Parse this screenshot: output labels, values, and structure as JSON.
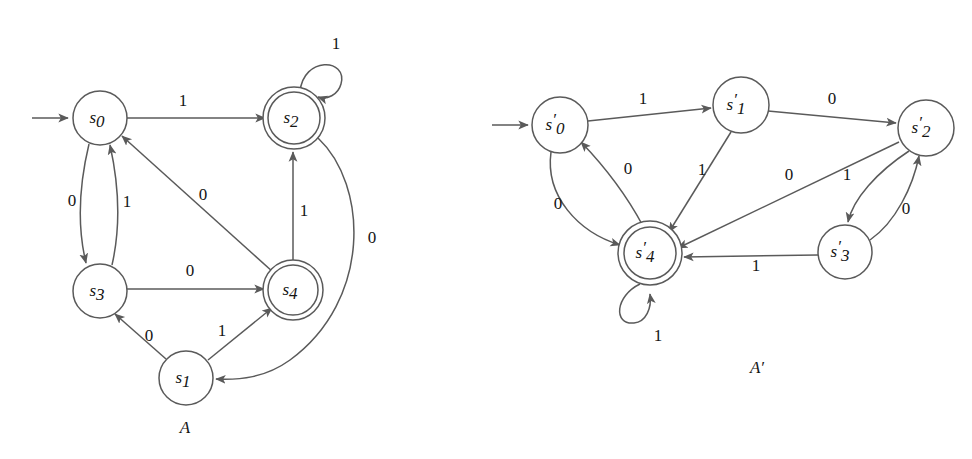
{
  "figure": {
    "background_color": "#ffffff",
    "stroke_color": "#5a5a5a",
    "text_color": "#141414"
  },
  "automata": [
    {
      "id": "A",
      "caption": "A",
      "caption_pos": {
        "x": 185,
        "y": 429
      },
      "start_arrow": {
        "x1": 32,
        "y1": 118,
        "x2": 70,
        "y2": 118
      },
      "states": [
        {
          "id": "s0",
          "base": "s",
          "sub": "0",
          "prime": "",
          "x": 100,
          "y": 118,
          "r": 27,
          "accepting": false
        },
        {
          "id": "s2",
          "base": "s",
          "sub": "2",
          "prime": "",
          "x": 294,
          "y": 118,
          "r": 26,
          "accepting": true
        },
        {
          "id": "s3",
          "base": "s",
          "sub": "3",
          "prime": "",
          "x": 100,
          "y": 291,
          "r": 27,
          "accepting": false
        },
        {
          "id": "s4",
          "base": "s",
          "sub": "4",
          "prime": "",
          "x": 293,
          "y": 290,
          "r": 25,
          "accepting": true
        },
        {
          "id": "s1",
          "base": "s",
          "sub": "1",
          "prime": "",
          "x": 186,
          "y": 378,
          "r": 27,
          "accepting": false
        }
      ],
      "transitions": [
        {
          "from": "s0",
          "to": "s2",
          "symbol": "1",
          "label_x": 183,
          "label_y": 102
        },
        {
          "from": "s2",
          "to": "s2",
          "symbol": "1",
          "label_x": 336,
          "label_y": 45,
          "self_loop": true
        },
        {
          "from": "s0",
          "to": "s3",
          "symbol": "0",
          "label_x": 72,
          "label_y": 202
        },
        {
          "from": "s3",
          "to": "s0",
          "symbol": "1",
          "label_x": 127,
          "label_y": 203
        },
        {
          "from": "s4",
          "to": "s0",
          "symbol": "0",
          "label_x": 203,
          "label_y": 196
        },
        {
          "from": "s4",
          "to": "s2",
          "symbol": "1",
          "label_x": 304,
          "label_y": 212
        },
        {
          "from": "s2",
          "to": "s1",
          "symbol": "0",
          "label_x": 372,
          "label_y": 239
        },
        {
          "from": "s3",
          "to": "s4",
          "symbol": "0",
          "label_x": 190,
          "label_y": 272
        },
        {
          "from": "s1",
          "to": "s3",
          "symbol": "0",
          "label_x": 149,
          "label_y": 337
        },
        {
          "from": "s1",
          "to": "s4",
          "symbol": "1",
          "label_x": 222,
          "label_y": 332
        }
      ]
    },
    {
      "id": "Aprime",
      "caption": "A′",
      "caption_pos": {
        "x": 757,
        "y": 369
      },
      "start_arrow": {
        "x1": 492,
        "y1": 125,
        "x2": 530,
        "y2": 125
      },
      "states": [
        {
          "id": "s0p",
          "base": "s",
          "sub": "0",
          "prime": "′",
          "x": 560,
          "y": 125,
          "r": 28,
          "accepting": false
        },
        {
          "id": "s1p",
          "base": "s",
          "sub": "1",
          "prime": "′",
          "x": 741,
          "y": 105,
          "r": 28,
          "accepting": false
        },
        {
          "id": "s2p",
          "base": "s",
          "sub": "2",
          "prime": "′",
          "x": 926,
          "y": 128,
          "r": 28,
          "accepting": false
        },
        {
          "id": "s4p",
          "base": "s",
          "sub": "4",
          "prime": "′",
          "x": 650,
          "y": 253,
          "r": 26,
          "accepting": true
        },
        {
          "id": "s3p",
          "base": "s",
          "sub": "3",
          "prime": "′",
          "x": 845,
          "y": 252,
          "r": 27,
          "accepting": false
        }
      ],
      "transitions": [
        {
          "from": "s0p",
          "to": "s1p",
          "symbol": "1",
          "label_x": 643,
          "label_y": 100
        },
        {
          "from": "s1p",
          "to": "s2p",
          "symbol": "0",
          "label_x": 832,
          "label_y": 100
        },
        {
          "from": "s0p",
          "to": "s4p",
          "symbol": "0",
          "label_x": 558,
          "label_y": 205
        },
        {
          "from": "s4p",
          "to": "s0p",
          "symbol": "0",
          "label_x": 628,
          "label_y": 170
        },
        {
          "from": "s1p",
          "to": "s4p",
          "symbol": "1",
          "label_x": 702,
          "label_y": 171
        },
        {
          "from": "s2p",
          "to": "s4p",
          "symbol": "0",
          "label_x": 789,
          "label_y": 176
        },
        {
          "from": "s2p",
          "to": "s3p",
          "symbol": "1",
          "label_x": 847,
          "label_y": 176
        },
        {
          "from": "s3p",
          "to": "s2p",
          "symbol": "0",
          "label_x": 906,
          "label_y": 210
        },
        {
          "from": "s3p",
          "to": "s4p",
          "symbol": "1",
          "label_x": 756,
          "label_y": 267
        },
        {
          "from": "s4p",
          "to": "s4p",
          "symbol": "1",
          "label_x": 658,
          "label_y": 337,
          "self_loop": true
        }
      ]
    }
  ]
}
